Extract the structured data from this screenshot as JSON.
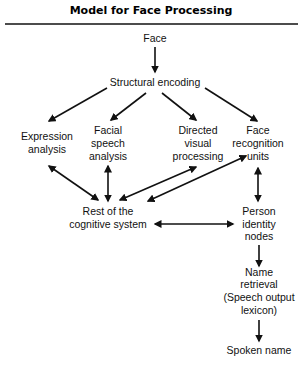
{
  "title": "Model for Face Processing",
  "nodes": {
    "face": {
      "lines": [
        "Face"
      ]
    },
    "structural_encoding": {
      "lines": [
        "Structural encoding"
      ]
    },
    "expression_analysis": {
      "lines": [
        "Expression",
        "analysis"
      ]
    },
    "facial_speech_analysis": {
      "lines": [
        "Facial",
        "speech",
        "analysis"
      ]
    },
    "directed_visual_processing": {
      "lines": [
        "Directed",
        "visual",
        "processing"
      ]
    },
    "face_recognition_units": {
      "lines": [
        "Face",
        "recognition",
        "units"
      ]
    },
    "rest_of_cognitive_system": {
      "lines": [
        "Rest of the",
        "cognitive system"
      ]
    },
    "person_identity_nodes": {
      "lines": [
        "Person",
        "identity",
        "nodes"
      ]
    },
    "name_retrieval": {
      "lines": [
        "Name",
        "retrieval",
        "(Speech output",
        "lexicon)"
      ]
    },
    "spoken_name": {
      "lines": [
        "Spoken name"
      ]
    }
  },
  "edges": [
    {
      "from": "Face",
      "to": "Structural encoding",
      "type": "one-way"
    },
    {
      "from": "Structural encoding",
      "to": "Expression analysis",
      "type": "one-way"
    },
    {
      "from": "Structural encoding",
      "to": "Facial speech analysis",
      "type": "one-way"
    },
    {
      "from": "Structural encoding",
      "to": "Directed visual processing",
      "type": "one-way"
    },
    {
      "from": "Structural encoding",
      "to": "Face recognition units",
      "type": "one-way"
    },
    {
      "from": "Expression analysis",
      "to": "Rest of the cognitive system",
      "type": "two-way"
    },
    {
      "from": "Facial speech analysis",
      "to": "Rest of the cognitive system",
      "type": "two-way"
    },
    {
      "from": "Directed visual processing",
      "to": "Rest of the cognitive system",
      "type": "two-way"
    },
    {
      "from": "Face recognition units",
      "to": "Rest of the cognitive system",
      "type": "two-way"
    },
    {
      "from": "Face recognition units",
      "to": "Person identity nodes",
      "type": "two-way"
    },
    {
      "from": "Rest of the cognitive system",
      "to": "Person identity nodes",
      "type": "two-way"
    },
    {
      "from": "Person identity nodes",
      "to": "Name retrieval (Speech output lexicon)",
      "type": "one-way"
    },
    {
      "from": "Name retrieval (Speech output lexicon)",
      "to": "Spoken name",
      "type": "one-way"
    }
  ]
}
